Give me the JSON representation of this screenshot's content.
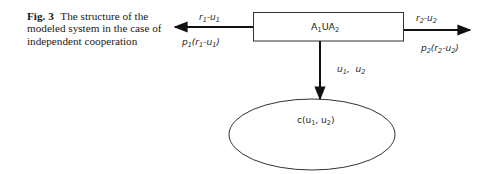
{
  "caption": {
    "label": "Fig. 3",
    "text": "The structure of the modeled system in the case of independent cooperation"
  },
  "diagram": {
    "box": {
      "main": "A",
      "sub1": "1",
      "mid": "UA",
      "sub2": "2"
    },
    "left_arrow": {
      "top_label": {
        "a": "r",
        "a_sub": "1",
        "sep": "-",
        "b": "u",
        "b_sub": "1"
      },
      "bottom_label": {
        "p": "p",
        "p_sub": "1",
        "open": "(r",
        "r_sub": "1",
        "sep": "-u",
        "u_sub": "1",
        "close": ")"
      }
    },
    "right_arrow": {
      "top_label": {
        "a": "r",
        "a_sub": "2",
        "sep": "-",
        "b": "u",
        "b_sub": "2"
      },
      "bottom_label": {
        "p": "p",
        "p_sub": "2",
        "open": "(r",
        "r_sub": "2",
        "sep": "-u",
        "u_sub": "2",
        "close": ")"
      }
    },
    "down_arrow": {
      "label": {
        "a": "u",
        "a_sub": "1",
        "sep": ",  u",
        "b_sub": "2"
      }
    },
    "ellipse": {
      "label": {
        "pre": "c(u",
        "sub1": "1",
        "mid": ", u",
        "sub2": "2",
        "close": ")"
      }
    },
    "colors": {
      "stroke": "#111111",
      "text": "#222222"
    }
  }
}
